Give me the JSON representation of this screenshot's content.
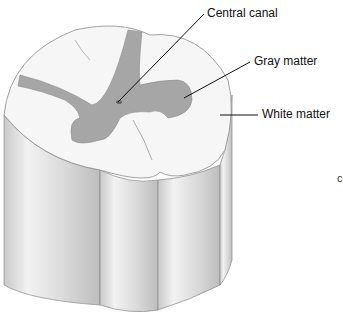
{
  "figure": {
    "labels": {
      "central_canal": "Central canal",
      "gray_matter": "Gray matter",
      "white_matter": "White matter"
    },
    "stray_text": "c"
  },
  "colors": {
    "gray_matter": "#a6a6a6",
    "white_matter": "#f4f4f4",
    "column_shade": "#d9d9d9",
    "outline": "#8a8a8a",
    "leader_line": "#111111"
  }
}
